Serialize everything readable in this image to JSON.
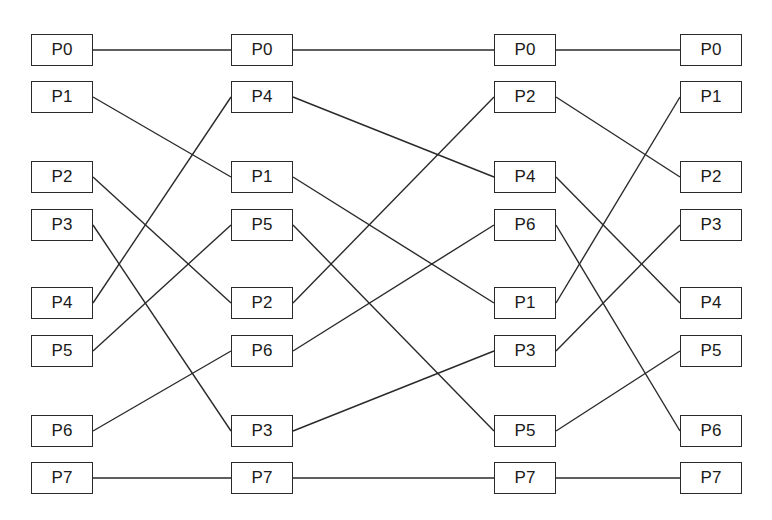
{
  "diagram": {
    "title": "",
    "box": {
      "width": 62,
      "height": 32
    },
    "colors": {
      "line": "#2a2a2a",
      "box_border": "#2a2a2a",
      "text": "#1a1a1a",
      "background": "#ffffff"
    },
    "row_y": [
      34,
      81,
      161,
      209,
      287,
      335,
      415,
      462
    ],
    "columns": [
      {
        "x": 31,
        "nodes": [
          "P0",
          "P1",
          "P2",
          "P3",
          "P4",
          "P5",
          "P6",
          "P7"
        ]
      },
      {
        "x": 231,
        "nodes": [
          "P0",
          "P4",
          "P1",
          "P5",
          "P2",
          "P6",
          "P3",
          "P7"
        ]
      },
      {
        "x": 494,
        "nodes": [
          "P0",
          "P2",
          "P4",
          "P6",
          "P1",
          "P3",
          "P5",
          "P7"
        ]
      },
      {
        "x": 680,
        "nodes": [
          "P0",
          "P1",
          "P2",
          "P3",
          "P4",
          "P5",
          "P6",
          "P7"
        ]
      }
    ],
    "edges": [
      {
        "from_col": 0,
        "from_row": 0,
        "to_row": 0
      },
      {
        "from_col": 0,
        "from_row": 1,
        "to_row": 2
      },
      {
        "from_col": 0,
        "from_row": 2,
        "to_row": 4
      },
      {
        "from_col": 0,
        "from_row": 3,
        "to_row": 6
      },
      {
        "from_col": 0,
        "from_row": 4,
        "to_row": 1
      },
      {
        "from_col": 0,
        "from_row": 5,
        "to_row": 3
      },
      {
        "from_col": 0,
        "from_row": 6,
        "to_row": 5
      },
      {
        "from_col": 0,
        "from_row": 7,
        "to_row": 7
      },
      {
        "from_col": 1,
        "from_row": 0,
        "to_row": 0
      },
      {
        "from_col": 1,
        "from_row": 1,
        "to_row": 2
      },
      {
        "from_col": 1,
        "from_row": 2,
        "to_row": 4
      },
      {
        "from_col": 1,
        "from_row": 3,
        "to_row": 6
      },
      {
        "from_col": 1,
        "from_row": 4,
        "to_row": 1
      },
      {
        "from_col": 1,
        "from_row": 5,
        "to_row": 3
      },
      {
        "from_col": 1,
        "from_row": 6,
        "to_row": 5
      },
      {
        "from_col": 1,
        "from_row": 7,
        "to_row": 7
      },
      {
        "from_col": 2,
        "from_row": 0,
        "to_row": 0
      },
      {
        "from_col": 2,
        "from_row": 1,
        "to_row": 2
      },
      {
        "from_col": 2,
        "from_row": 2,
        "to_row": 4
      },
      {
        "from_col": 2,
        "from_row": 3,
        "to_row": 6
      },
      {
        "from_col": 2,
        "from_row": 4,
        "to_row": 1
      },
      {
        "from_col": 2,
        "from_row": 5,
        "to_row": 3
      },
      {
        "from_col": 2,
        "from_row": 6,
        "to_row": 5
      },
      {
        "from_col": 2,
        "from_row": 7,
        "to_row": 7
      }
    ]
  }
}
